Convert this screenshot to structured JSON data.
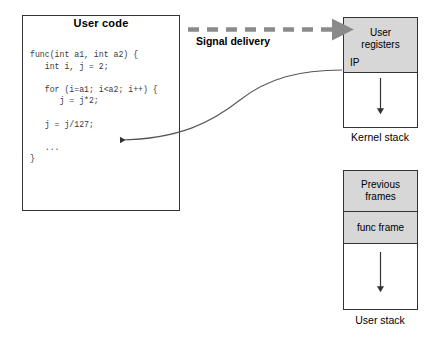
{
  "diagram": {
    "colors": {
      "shade": "#d7d7d7",
      "stroke": "#333333",
      "dashed_arrow": "#8a8a8a",
      "code_text": "#3a3a3a",
      "background": "#ffffff"
    }
  },
  "code_panel": {
    "title": "User code",
    "listing": "func(int a1, int a2) {\n   int i, j = 2;\n\n   for (i=a1; i<a2; i++) {\n      j = j*2;\n\n   j = j/127;\n\n   ...\n}"
  },
  "signal": {
    "label": "Signal delivery"
  },
  "kernel_stack": {
    "caption": "Kernel stack",
    "cells": [
      {
        "label": "User\nregisters",
        "shaded": true,
        "marker": "IP"
      },
      {
        "label": "",
        "shaded": false,
        "arrow": "down"
      }
    ],
    "registers_line1": "User",
    "registers_line2": "registers",
    "ip_label": "IP"
  },
  "user_stack": {
    "caption": "User stack",
    "cells": [
      {
        "label": "Previous\nframes",
        "shaded": true
      },
      {
        "label": "func frame",
        "shaded": true
      },
      {
        "label": "",
        "shaded": false,
        "arrow": "down"
      }
    ],
    "previous_line1": "Previous",
    "previous_line2": "frames",
    "func_frame": "func frame"
  }
}
